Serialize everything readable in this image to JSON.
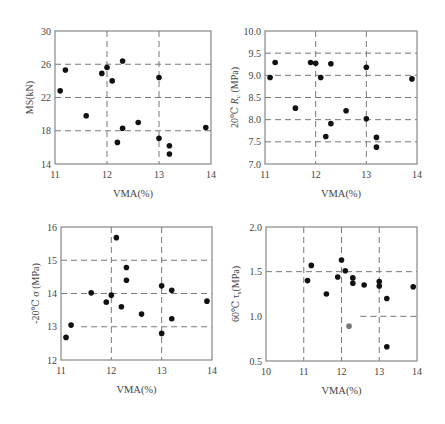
{
  "figure": {
    "width": 445,
    "height": 424,
    "marker_color": "#111111",
    "highlight_marker_color": "#777777",
    "axis_color": "#888888",
    "grid_color": "#777777"
  },
  "chart_data": [
    {
      "id": "ms",
      "type": "scatter",
      "title": "",
      "xlabel": "VMA(%)",
      "ylabel": "MS(kN)",
      "xlim": [
        11,
        14
      ],
      "ylim": [
        14,
        30
      ],
      "xticks": [
        "11",
        "12",
        "13",
        "14"
      ],
      "xtick_values": [
        11,
        12,
        13,
        14
      ],
      "yticks": [
        "14",
        "18",
        "22",
        "26",
        "30"
      ],
      "ytick_values": [
        14,
        18,
        22,
        26,
        30
      ],
      "grid": {
        "x": [
          12,
          13
        ],
        "y": [
          18,
          22,
          26
        ],
        "style": "dashed"
      },
      "legend": null,
      "box": {
        "left": 55,
        "top": 31,
        "right": 211,
        "bottom": 164
      },
      "points": [
        {
          "x": 11.1,
          "y": 22.8
        },
        {
          "x": 11.2,
          "y": 25.3
        },
        {
          "x": 11.6,
          "y": 19.8
        },
        {
          "x": 11.9,
          "y": 24.9
        },
        {
          "x": 12.0,
          "y": 25.6
        },
        {
          "x": 12.1,
          "y": 24.0
        },
        {
          "x": 12.3,
          "y": 26.4
        },
        {
          "x": 12.2,
          "y": 16.6
        },
        {
          "x": 12.3,
          "y": 18.3
        },
        {
          "x": 12.6,
          "y": 19.0
        },
        {
          "x": 13.0,
          "y": 24.4
        },
        {
          "x": 13.0,
          "y": 17.1
        },
        {
          "x": 13.2,
          "y": 16.2
        },
        {
          "x": 13.2,
          "y": 15.2
        },
        {
          "x": 13.9,
          "y": 18.4
        }
      ]
    },
    {
      "id": "rc",
      "type": "scatter",
      "title": "",
      "xlabel": "VMA(%)",
      "ylabel": "20℃ Rc (MPa)",
      "ylabel_main": "20℃ ",
      "ylabel_var": "R",
      "ylabel_sub": "c",
      "ylabel_unit": " (MPa)",
      "xlim": [
        11,
        14
      ],
      "ylim": [
        7.0,
        10.0
      ],
      "xticks": [
        "11",
        "12",
        "13",
        "14"
      ],
      "xtick_values": [
        11,
        12,
        13,
        14
      ],
      "yticks": [
        "7.0",
        "7.5",
        "8.0",
        "8.5",
        "9.0",
        "9.5",
        "10.0"
      ],
      "ytick_values": [
        7.0,
        7.5,
        8.0,
        8.5,
        9.0,
        9.5,
        10.0
      ],
      "grid": {
        "x": [
          12,
          13
        ],
        "y": [
          7.5,
          8.0,
          8.5,
          9.0,
          9.5
        ],
        "style": "dashed"
      },
      "legend": null,
      "box": {
        "left": 265,
        "top": 31,
        "right": 417,
        "bottom": 164
      },
      "points": [
        {
          "x": 11.1,
          "y": 8.95
        },
        {
          "x": 11.2,
          "y": 9.29
        },
        {
          "x": 11.6,
          "y": 8.26
        },
        {
          "x": 11.9,
          "y": 9.29
        },
        {
          "x": 12.0,
          "y": 9.27
        },
        {
          "x": 12.1,
          "y": 8.95
        },
        {
          "x": 12.3,
          "y": 9.26
        },
        {
          "x": 12.2,
          "y": 7.62
        },
        {
          "x": 12.3,
          "y": 7.91
        },
        {
          "x": 12.6,
          "y": 8.2
        },
        {
          "x": 13.0,
          "y": 9.18
        },
        {
          "x": 13.0,
          "y": 8.02
        },
        {
          "x": 13.2,
          "y": 7.6
        },
        {
          "x": 13.2,
          "y": 7.38
        },
        {
          "x": 13.9,
          "y": 8.92
        }
      ]
    },
    {
      "id": "sigma",
      "type": "scatter",
      "title": "",
      "xlabel": "VMA(%)",
      "ylabel": "-20℃ σ (MPa)",
      "xlim": [
        11,
        14
      ],
      "ylim": [
        12,
        16
      ],
      "xticks": [
        "11",
        "12",
        "13",
        "14"
      ],
      "xtick_values": [
        11,
        12,
        13,
        14
      ],
      "yticks": [
        "12",
        "13",
        "14",
        "15",
        "16"
      ],
      "ytick_values": [
        12,
        13,
        14,
        15,
        16
      ],
      "grid": {
        "x": [
          12,
          13
        ],
        "y": [
          13,
          14,
          15
        ],
        "style": "dashed",
        "partial": {
          "13": [
            11.4,
            14
          ]
        }
      },
      "legend": null,
      "box": {
        "left": 61,
        "top": 227,
        "right": 212,
        "bottom": 360
      },
      "points": [
        {
          "x": 11.1,
          "y": 12.68
        },
        {
          "x": 11.2,
          "y": 13.05
        },
        {
          "x": 11.6,
          "y": 14.02
        },
        {
          "x": 11.9,
          "y": 13.74
        },
        {
          "x": 12.0,
          "y": 13.95
        },
        {
          "x": 12.1,
          "y": 15.68
        },
        {
          "x": 12.2,
          "y": 13.6
        },
        {
          "x": 12.3,
          "y": 14.78
        },
        {
          "x": 12.3,
          "y": 14.4
        },
        {
          "x": 12.6,
          "y": 13.38
        },
        {
          "x": 13.0,
          "y": 14.23
        },
        {
          "x": 13.0,
          "y": 12.8
        },
        {
          "x": 13.2,
          "y": 14.1
        },
        {
          "x": 13.2,
          "y": 13.24
        },
        {
          "x": 13.9,
          "y": 13.77
        }
      ]
    },
    {
      "id": "tau",
      "type": "scatter",
      "title": "",
      "xlabel": "VMA(%)",
      "ylabel": "60℃ τs(MPa)",
      "ylabel_main": "60℃ τ",
      "ylabel_sub": "s",
      "ylabel_unit": "(MPa)",
      "xlim": [
        10,
        14
      ],
      "ylim": [
        0.5,
        2.0
      ],
      "xticks": [
        "10",
        "11",
        "12",
        "13",
        "14"
      ],
      "xtick_values": [
        10,
        11,
        12,
        13,
        14
      ],
      "yticks": [
        "0.5",
        "1.0",
        "1.5",
        "2.0"
      ],
      "ytick_values": [
        0.5,
        1.0,
        1.5,
        2.0
      ],
      "grid": {
        "x": [
          11,
          12,
          13
        ],
        "y": [
          1.0,
          1.5
        ],
        "style": "dashed",
        "partial": {
          "1.0": [
            12.5,
            14
          ]
        }
      },
      "legend": null,
      "box": {
        "left": 266,
        "top": 227,
        "right": 417,
        "bottom": 361
      },
      "points": [
        {
          "x": 11.1,
          "y": 1.4
        },
        {
          "x": 11.2,
          "y": 1.57
        },
        {
          "x": 11.6,
          "y": 1.25
        },
        {
          "x": 11.9,
          "y": 1.44
        },
        {
          "x": 12.0,
          "y": 1.63
        },
        {
          "x": 12.1,
          "y": 1.51
        },
        {
          "x": 12.2,
          "y": 0.89,
          "highlight": true
        },
        {
          "x": 12.3,
          "y": 1.43
        },
        {
          "x": 12.3,
          "y": 1.37
        },
        {
          "x": 12.6,
          "y": 1.35
        },
        {
          "x": 13.0,
          "y": 1.39
        },
        {
          "x": 13.0,
          "y": 1.34
        },
        {
          "x": 13.2,
          "y": 1.2
        },
        {
          "x": 13.2,
          "y": 0.66
        },
        {
          "x": 13.9,
          "y": 1.33
        }
      ]
    }
  ]
}
